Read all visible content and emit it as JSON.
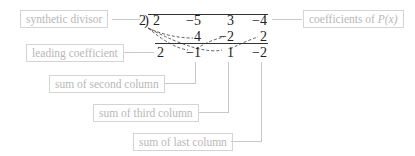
{
  "labels": {
    "synthetic_divisor": "synthetic divisor",
    "coefficients": "coefficients of ",
    "coefficients_italic": "P(x)",
    "leading_coefficient": "leading coefficient",
    "sum_second": "sum of second column",
    "sum_third": "sum of third column",
    "sum_last": "sum of last column"
  },
  "division": {
    "divisor": "2",
    "top_row": [
      "2",
      "−5",
      "3",
      "−4"
    ],
    "middle_row": [
      "",
      "4",
      "−2",
      "2"
    ],
    "bottom_row": [
      "2",
      "−1",
      "1",
      "−2"
    ]
  }
}
